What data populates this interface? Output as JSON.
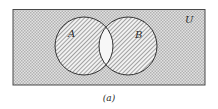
{
  "diagram": {
    "type": "venn",
    "universe_label": "U",
    "sets": [
      {
        "label": "A",
        "cx": 84,
        "cy": 46,
        "r": 29,
        "shading": "diagonal-hatch"
      },
      {
        "label": "B",
        "cx": 128,
        "cy": 46,
        "r": 29,
        "shading": "diagonal-hatch"
      }
    ],
    "intersection_shading": "none",
    "universe_shading": "crosshatch",
    "caption": "(a)",
    "colors": {
      "outline": "#3a3a3a",
      "hatch": "#9a9a9a",
      "crosshatch": "#a8a8a8",
      "background": "#ffffff"
    }
  }
}
